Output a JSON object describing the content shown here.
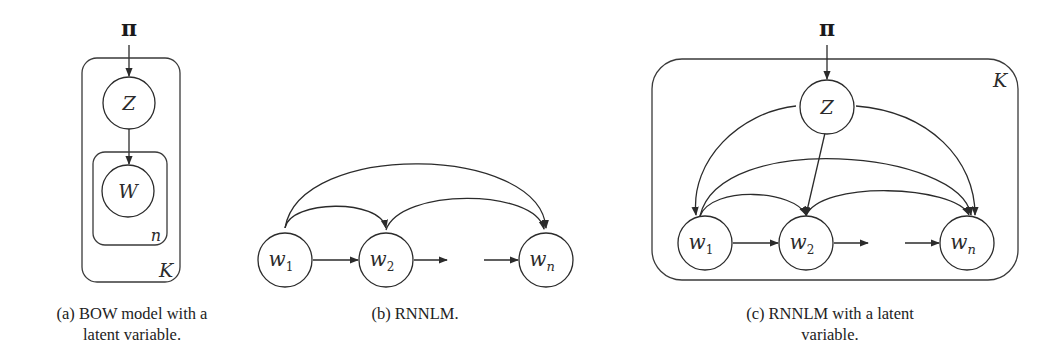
{
  "figures": {
    "a": {
      "caption_line1": "(a) BOW model with a",
      "caption_line2": "latent variable.",
      "prior": "π",
      "latent": "Z",
      "observed": "W",
      "inner_plate_label": "n",
      "outer_plate_label": "K"
    },
    "b": {
      "caption_line1": "(b) RNNLM.",
      "nodes": [
        {
          "base": "w",
          "sub": "1"
        },
        {
          "base": "w",
          "sub": "2"
        },
        {
          "base": "w",
          "sub": "n"
        }
      ]
    },
    "c": {
      "caption_line1": "(c) RNNLM with a latent",
      "caption_line2": "variable.",
      "prior": "π",
      "latent": "Z",
      "plate_label": "K",
      "nodes": [
        {
          "base": "w",
          "sub": "1"
        },
        {
          "base": "w",
          "sub": "2"
        },
        {
          "base": "w",
          "sub": "n"
        }
      ]
    }
  },
  "colors": {
    "stroke": "#2b2b2b",
    "background": "#ffffff"
  }
}
